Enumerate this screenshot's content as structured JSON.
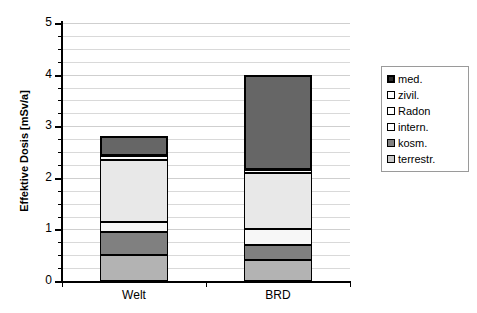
{
  "chart_data": {
    "type": "bar",
    "stacked": true,
    "title": "",
    "xlabel": "",
    "ylabel": "Effektive Dosis [mSv/a]",
    "categories": [
      "Welt",
      "BRD"
    ],
    "ylim": [
      0,
      5
    ],
    "ytick_labels": [
      "0",
      "1",
      "2",
      "3",
      "4",
      "5"
    ],
    "ytick_values": [
      0,
      1,
      2,
      3,
      4,
      5
    ],
    "minor_gridline_interval": 0.25,
    "grid": true,
    "legend_position": "right",
    "series": [
      {
        "name": "terrestr.",
        "color": "#b3b3b3",
        "values": [
          0.5,
          0.4
        ]
      },
      {
        "name": "kosm.",
        "color": "#808080",
        "values": [
          0.45,
          0.3
        ]
      },
      {
        "name": "intern.",
        "color": "#f7f7f7",
        "values": [
          0.2,
          0.3
        ]
      },
      {
        "name": "Radon",
        "color": "#e8e8e8",
        "values": [
          1.2,
          1.1
        ]
      },
      {
        "name": "zivil.",
        "color": "#fcfcfc",
        "values": [
          0.07,
          0.05
        ]
      },
      {
        "name": "med.",
        "color": "#666666",
        "values": [
          0.4,
          1.85
        ]
      }
    ],
    "totals": [
      2.82,
      4.0
    ],
    "legend_order": [
      "med.",
      "zivil.",
      "Radon",
      "intern.",
      "kosm.",
      "terrestr."
    ]
  },
  "axes": {
    "y_title": "Effektive Dosis [mSv/a]",
    "y_ticks": [
      {
        "label": "5",
        "value": 5
      },
      {
        "label": "4",
        "value": 4
      },
      {
        "label": "3",
        "value": 3
      },
      {
        "label": "2",
        "value": 2
      },
      {
        "label": "1",
        "value": 1
      },
      {
        "label": "0",
        "value": 0
      }
    ],
    "x_ticks": [
      {
        "label": "Welt"
      },
      {
        "label": "BRD"
      }
    ]
  },
  "legend": {
    "items": [
      {
        "label": "med.",
        "swatch": "med"
      },
      {
        "label": "zivil.",
        "swatch": "zivil"
      },
      {
        "label": "Radon",
        "swatch": "radon"
      },
      {
        "label": "intern.",
        "swatch": "intern"
      },
      {
        "label": "kosm.",
        "swatch": "kosm"
      },
      {
        "label": "terrestr.",
        "swatch": "terrestr"
      }
    ]
  }
}
